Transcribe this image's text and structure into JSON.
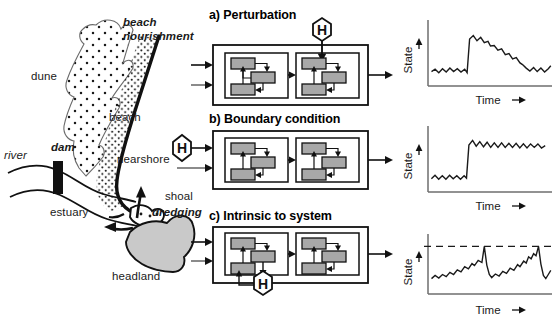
{
  "figure": {
    "left_map": {
      "name": "coastal-sediment-system-map",
      "labels": [
        {
          "id": "beach-nourishment",
          "text": "beach",
          "text2": "nourishment",
          "style": "bold-italic"
        },
        {
          "id": "dune",
          "text": "dune",
          "style": "plain"
        },
        {
          "id": "beach",
          "text": "beach",
          "style": "plain"
        },
        {
          "id": "river",
          "text": "river",
          "style": "italic"
        },
        {
          "id": "dam",
          "text": "dam",
          "style": "bold-italic"
        },
        {
          "id": "nearshore",
          "text": "nearshore",
          "style": "plain"
        },
        {
          "id": "shoal",
          "text": "shoal",
          "style": "plain"
        },
        {
          "id": "dredging",
          "text": "dredging",
          "style": "bold-italic"
        },
        {
          "id": "estuary",
          "text": "estuary",
          "style": "plain"
        },
        {
          "id": "headland",
          "text": "headland",
          "style": "plain"
        }
      ]
    },
    "panels": [
      {
        "key": "a",
        "title": "a) Perturbation",
        "h_marker": "H",
        "h_position": "top-external-into-right-subsystem"
      },
      {
        "key": "b",
        "title": "b) Boundary condition",
        "h_marker": "H",
        "h_position": "left-external-input"
      },
      {
        "key": "c",
        "title": "c) Intrinsic to system",
        "h_marker": "H",
        "h_position": "inside-left-subsystem-bottom"
      }
    ],
    "colors": {
      "box_fill": "#a8a8a8",
      "box_stroke": "#1a1a1a",
      "headland_fill": "#c9c9c9",
      "line": "#1a1a1a",
      "axis": "#6e6e6e"
    }
  },
  "chart_data": [
    {
      "type": "line",
      "panel": "a",
      "title": "Perturbation response",
      "xlabel": "Time",
      "ylabel": "State",
      "xlim": [
        0,
        100
      ],
      "ylim": [
        0,
        100
      ],
      "grid": false,
      "legend": null,
      "annotations": [],
      "description": "Low noisy baseline, abrupt rise to a peak, then gradual decay back to the original baseline level.",
      "points": [
        [
          2,
          18
        ],
        [
          5,
          22
        ],
        [
          8,
          16
        ],
        [
          11,
          23
        ],
        [
          14,
          17
        ],
        [
          17,
          24
        ],
        [
          20,
          18
        ],
        [
          23,
          23
        ],
        [
          26,
          17
        ],
        [
          29,
          22
        ],
        [
          31,
          16
        ],
        [
          33,
          74
        ],
        [
          36,
          80
        ],
        [
          39,
          71
        ],
        [
          42,
          77
        ],
        [
          45,
          68
        ],
        [
          48,
          70
        ],
        [
          50,
          62
        ],
        [
          53,
          63
        ],
        [
          56,
          55
        ],
        [
          59,
          57
        ],
        [
          62,
          47
        ],
        [
          65,
          49
        ],
        [
          68,
          40
        ],
        [
          71,
          42
        ],
        [
          74,
          33
        ],
        [
          76,
          30
        ],
        [
          79,
          24
        ],
        [
          82,
          19
        ],
        [
          85,
          25
        ],
        [
          88,
          18
        ],
        [
          91,
          24
        ],
        [
          94,
          17
        ],
        [
          97,
          23
        ],
        [
          99,
          28
        ]
      ]
    },
    {
      "type": "line",
      "panel": "b",
      "title": "Boundary condition response",
      "xlabel": "Time",
      "ylabel": "State",
      "xlim": [
        0,
        100
      ],
      "ylim": [
        0,
        100
      ],
      "grid": false,
      "legend": null,
      "annotations": [],
      "description": "Low noisy baseline followed by an abrupt step up to a new, sustained higher level with continued oscillation.",
      "points": [
        [
          2,
          16
        ],
        [
          5,
          22
        ],
        [
          8,
          15
        ],
        [
          11,
          21
        ],
        [
          14,
          15
        ],
        [
          17,
          22
        ],
        [
          20,
          16
        ],
        [
          23,
          21
        ],
        [
          26,
          15
        ],
        [
          29,
          21
        ],
        [
          31,
          17
        ],
        [
          33,
          74
        ],
        [
          36,
          82
        ],
        [
          39,
          72
        ],
        [
          42,
          80
        ],
        [
          45,
          71
        ],
        [
          48,
          79
        ],
        [
          51,
          70
        ],
        [
          54,
          78
        ],
        [
          57,
          70
        ],
        [
          60,
          78
        ],
        [
          63,
          70
        ],
        [
          66,
          77
        ],
        [
          69,
          70
        ],
        [
          72,
          77
        ],
        [
          75,
          69
        ],
        [
          78,
          76
        ],
        [
          81,
          69
        ],
        [
          84,
          76
        ],
        [
          87,
          70
        ],
        [
          90,
          76
        ],
        [
          93,
          69
        ],
        [
          96,
          73
        ]
      ]
    },
    {
      "type": "line",
      "panel": "c",
      "title": "Intrinsic (self-organised) response",
      "xlabel": "Time",
      "ylabel": "State",
      "xlim": [
        0,
        100
      ],
      "ylim": [
        0,
        100
      ],
      "grid": false,
      "legend": null,
      "threshold": 80,
      "threshold_style": "dashed",
      "annotations": [
        {
          "type": "hline",
          "value": 80,
          "style": "dashed"
        }
      ],
      "description": "Sawtooth cycles: state builds gradually until it reaches the dashed threshold, then collapses abruptly and rebuilds.",
      "points": [
        [
          2,
          18
        ],
        [
          5,
          24
        ],
        [
          8,
          19
        ],
        [
          11,
          26
        ],
        [
          14,
          22
        ],
        [
          17,
          30
        ],
        [
          20,
          26
        ],
        [
          23,
          35
        ],
        [
          26,
          31
        ],
        [
          29,
          41
        ],
        [
          32,
          37
        ],
        [
          35,
          47
        ],
        [
          37,
          43
        ],
        [
          40,
          53
        ],
        [
          43,
          49
        ],
        [
          45,
          80
        ],
        [
          47,
          44
        ],
        [
          49,
          26
        ],
        [
          51,
          20
        ],
        [
          54,
          27
        ],
        [
          57,
          23
        ],
        [
          60,
          32
        ],
        [
          63,
          28
        ],
        [
          66,
          38
        ],
        [
          69,
          34
        ],
        [
          72,
          45
        ],
        [
          74,
          41
        ],
        [
          77,
          52
        ],
        [
          79,
          48
        ],
        [
          81,
          60
        ],
        [
          83,
          56
        ],
        [
          85,
          66
        ],
        [
          87,
          62
        ],
        [
          89,
          80
        ],
        [
          91,
          46
        ],
        [
          93,
          24
        ],
        [
          95,
          18
        ],
        [
          97,
          26
        ],
        [
          99,
          34
        ]
      ]
    }
  ]
}
